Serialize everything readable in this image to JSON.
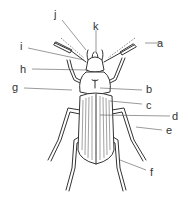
{
  "diagram": {
    "labels": [
      {
        "id": "a",
        "text": "a"
      },
      {
        "id": "b",
        "text": "b"
      },
      {
        "id": "c",
        "text": "c"
      },
      {
        "id": "d",
        "text": "d"
      },
      {
        "id": "e",
        "text": "e"
      },
      {
        "id": "f",
        "text": "f"
      },
      {
        "id": "g",
        "text": "g"
      },
      {
        "id": "h",
        "text": "h"
      },
      {
        "id": "i",
        "text": "i"
      },
      {
        "id": "j",
        "text": "j"
      },
      {
        "id": "k",
        "text": "k"
      }
    ],
    "colors": {
      "ink": "#333333",
      "background": "#ffffff"
    }
  }
}
